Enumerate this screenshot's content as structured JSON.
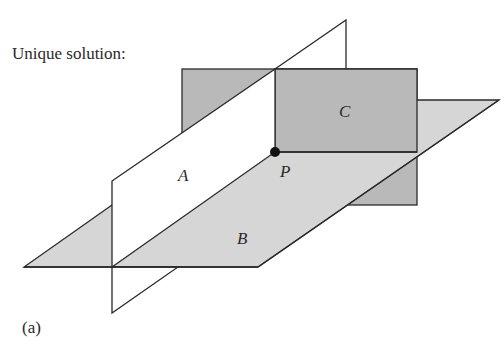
{
  "title": "Unique solution:",
  "caption": "(a)",
  "planes": {
    "A": {
      "label": "A",
      "fill": "#ffffff"
    },
    "B": {
      "label": "B",
      "fill": "#d6d6d6"
    },
    "C": {
      "label": "C",
      "fill": "#b9b9b9"
    }
  },
  "point": {
    "label": "P"
  },
  "colors": {
    "stroke": "#2a2a2a",
    "plane_b": "#d6d6d6",
    "plane_c": "#b9b9b9"
  }
}
